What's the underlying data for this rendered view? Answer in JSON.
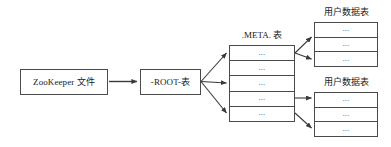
{
  "diagram": {
    "background_color": "#ffffff",
    "line_color": "#4a4a4a",
    "text_color": "#1a1a1a"
  },
  "nodes": {
    "zookeeper": {
      "label": "ZooKeeper 文件"
    },
    "root": {
      "label": "-ROOT-表"
    }
  },
  "meta_table": {
    "caption": ".META. 表",
    "rows": [
      {
        "text": "..."
      },
      {
        "text": "..."
      },
      {
        "text": "..."
      },
      {
        "text": "..."
      },
      {
        "text": "..."
      }
    ]
  },
  "user_tables": [
    {
      "caption": "用户数据表",
      "rows": [
        {
          "text": "..."
        },
        {
          "text": "..."
        },
        {
          "text": "..."
        }
      ]
    },
    {
      "caption": "用户数据表",
      "rows": [
        {
          "text": "..."
        },
        {
          "text": "..."
        },
        {
          "text": "..."
        }
      ]
    }
  ],
  "connectors": [
    {
      "name": "zookeeper-to-root"
    },
    {
      "name": "root-to-meta-row-1"
    },
    {
      "name": "root-to-meta-row-3"
    },
    {
      "name": "root-to-meta-row-5"
    },
    {
      "name": "meta-to-user-table-1-row-1"
    },
    {
      "name": "meta-to-user-table-1-row-2"
    },
    {
      "name": "meta-to-user-table-2-row-1"
    },
    {
      "name": "meta-to-user-table-2-row-3"
    }
  ]
}
